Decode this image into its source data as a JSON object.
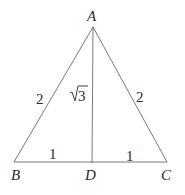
{
  "diagram": {
    "type": "geometry-triangle",
    "colors": {
      "background": "#ffffff",
      "line": "#6a6a6a",
      "text": "#2a2a2a"
    },
    "vertices": {
      "A": {
        "label": "A",
        "x": 93,
        "y": 27
      },
      "B": {
        "label": "B",
        "x": 14,
        "y": 162
      },
      "C": {
        "label": "C",
        "x": 167,
        "y": 162
      },
      "D": {
        "label": "D",
        "x": 92,
        "y": 163
      }
    },
    "segments": [
      {
        "from": "A",
        "to": "B",
        "length_label": "2"
      },
      {
        "from": "A",
        "to": "C",
        "length_label": "2"
      },
      {
        "from": "A",
        "to": "D",
        "length_label": "√3"
      },
      {
        "from": "B",
        "to": "D",
        "length_label": "1"
      },
      {
        "from": "D",
        "to": "C",
        "length_label": "1"
      }
    ],
    "labels": {
      "A": "A",
      "B": "B",
      "C": "C",
      "D": "D",
      "AB": "2",
      "AC": "2",
      "AD_radicand": "3",
      "BD": "1",
      "DC": "1"
    }
  }
}
